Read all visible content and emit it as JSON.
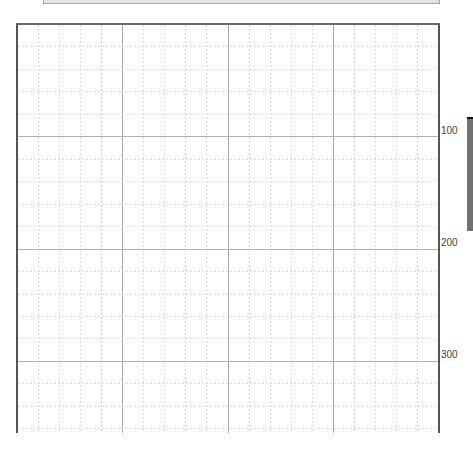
{
  "canvas": {
    "grid": {
      "major_columns": 4,
      "minor_per_major_column": 5,
      "major_rows_visible": 3,
      "minor_per_major_row": 5
    },
    "ruler": {
      "labels": [
        "100",
        "200",
        "300"
      ]
    }
  },
  "colors": {
    "grid_major": "#aaaaaa",
    "grid_minor": "#dadada",
    "border": "#555555",
    "side_panel": "#707070"
  }
}
